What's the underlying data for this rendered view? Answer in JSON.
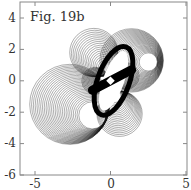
{
  "chart_data": {
    "type": "line",
    "title": "Fig. 19b",
    "xlabel": "",
    "ylabel": "",
    "xlim": [
      -6,
      5
    ],
    "ylim": [
      -6,
      5
    ],
    "xticks": [
      -5,
      0,
      5
    ],
    "yticks": [
      4,
      2,
      0,
      -2,
      -4,
      -6
    ],
    "grid": false,
    "legend": null,
    "families": [
      {
        "name": "lower-left",
        "cx_start": -2.7,
        "cy_start": -1.5,
        "r_start": 2.65,
        "cx_end": -1.2,
        "cy_end": -2.2,
        "r_end": 0.9,
        "count": 28
      },
      {
        "name": "upper-right",
        "cx_start": 1.4,
        "cy_start": 1.3,
        "r_start": 2.1,
        "cx_end": 2.5,
        "cy_end": 1.2,
        "r_end": 0.6,
        "count": 26
      },
      {
        "name": "upper-left",
        "cx_start": -1.1,
        "cy_start": 1.8,
        "r_start": 1.6,
        "cx_end": -0.2,
        "cy_end": 0.7,
        "r_end": 0.4,
        "count": 20
      },
      {
        "name": "lower-center",
        "cx_start": 0.6,
        "cy_start": -2.1,
        "r_start": 1.5,
        "cx_end": 0.3,
        "cy_end": -1.0,
        "r_end": 0.4,
        "count": 20
      },
      {
        "name": "center-left",
        "cx_start": -1.0,
        "cy_start": 0.0,
        "r_start": 0.9,
        "cx_end": -0.5,
        "cy_end": 0.1,
        "r_end": 0.3,
        "count": 14
      },
      {
        "name": "center-right",
        "cx_start": 1.0,
        "cy_start": 0.3,
        "r_start": 0.9,
        "cx_end": 0.5,
        "cy_end": 0.2,
        "r_end": 0.3,
        "count": 14
      }
    ],
    "central_ellipse": {
      "cx": 0.2,
      "cy": 0.0,
      "rx": 0.7,
      "ry": 2.0,
      "rotate_deg": 20
    }
  },
  "figure": {
    "label": "Fig. 19b",
    "x_tick_labels": [
      "-5",
      "0",
      "5"
    ],
    "y_tick_labels": [
      "4",
      "2",
      "0",
      "-2",
      "-4",
      "-6"
    ]
  }
}
